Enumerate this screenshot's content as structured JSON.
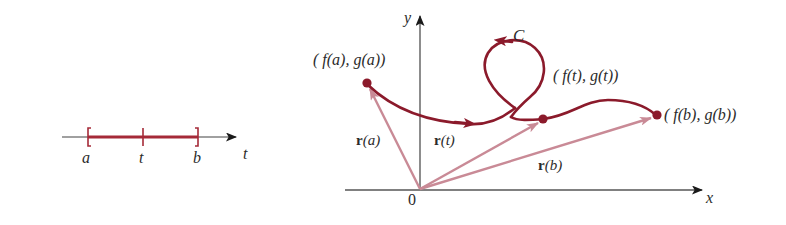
{
  "figure": {
    "colors": {
      "curve": "#8B1A2B",
      "interval_segment": "#A52A38",
      "vector": "#C98A96",
      "axis": "#808080",
      "arrowhead_dark": "#1a1a1a",
      "text": "#2b2b2b",
      "background": "#ffffff"
    }
  },
  "interval_panel": {
    "axis_label": "t",
    "ticks": [
      {
        "label": "a",
        "x": 88
      },
      {
        "label": "t",
        "x": 143
      },
      {
        "label": "b",
        "x": 198
      }
    ],
    "segment": {
      "from": "a",
      "to": "b"
    }
  },
  "plane_panel": {
    "x_axis_label": "x",
    "y_axis_label": "y",
    "origin_label": "0",
    "curve_label": "C",
    "points": [
      {
        "name": "start",
        "label": "( f(a), g(a))",
        "x": 367,
        "y": 83
      },
      {
        "name": "middle",
        "label": "( f(t), g(t))",
        "x": 543,
        "y": 119
      },
      {
        "name": "end",
        "label": "( f(b), g(b))",
        "x": 657,
        "y": 115
      }
    ],
    "vectors": [
      {
        "name": "r-a",
        "bold": "r",
        "arg": "(a)"
      },
      {
        "name": "r-t",
        "bold": "r",
        "arg": "(t)"
      },
      {
        "name": "r-b",
        "bold": "r",
        "arg": "(b)"
      }
    ]
  }
}
